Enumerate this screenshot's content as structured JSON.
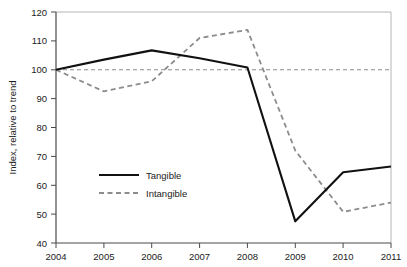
{
  "chart_data": {
    "type": "line",
    "title": "",
    "xlabel": "",
    "ylabel": "Index, relative to trend",
    "x": [
      2004,
      2005,
      2006,
      2007,
      2008,
      2009,
      2010,
      2011
    ],
    "xticklabels": [
      "2004",
      "2005",
      "2006",
      "2007",
      "2008",
      "2009",
      "2010",
      "2011"
    ],
    "yticks": [
      40,
      50,
      60,
      70,
      80,
      90,
      100,
      110,
      120
    ],
    "yticklabels": [
      "40",
      "50",
      "60",
      "70",
      "80",
      "90",
      "100",
      "110",
      "120"
    ],
    "xlim": [
      2004,
      2011
    ],
    "ylim": [
      40,
      120
    ],
    "grid": false,
    "legend_position": "center-left",
    "reference_line": {
      "name": "trend-baseline",
      "value": 100,
      "style": "dashed",
      "color": "#8c8c8c"
    },
    "series": [
      {
        "name": "Tangible",
        "style": "solid",
        "color": "#111111",
        "values": [
          100,
          103.5,
          106.7,
          104.0,
          100.8,
          47.5,
          64.5,
          66.5
        ]
      },
      {
        "name": "Intangible",
        "style": "dashed",
        "color": "#8c8c8c",
        "values": [
          100,
          92.5,
          96.0,
          111.0,
          113.8,
          72.0,
          50.8,
          54.0
        ]
      }
    ]
  },
  "legend": {
    "items": [
      {
        "label": "Tangible",
        "style": "solid",
        "color": "#111111"
      },
      {
        "label": "Intangible",
        "style": "dashed",
        "color": "#8c8c8c"
      }
    ]
  },
  "colors": {
    "tangible": "#111111",
    "intangible": "#8c8c8c",
    "axis": "#4a4a4a",
    "frame": "#b5b5b5",
    "background": "#ffffff"
  }
}
